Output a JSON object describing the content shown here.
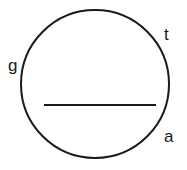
{
  "figure": {
    "type": "geometry-diagram",
    "background_color": "#ffffff",
    "stroke_color": "#1a1a1a",
    "stroke_width": 2,
    "canvas": {
      "width": 187,
      "height": 170
    },
    "circle": {
      "name": "circle-outline",
      "center_x": 95,
      "center_y": 84,
      "radius": 74,
      "fill": "none"
    },
    "chord": {
      "name": "horizontal-chord",
      "x1": 44,
      "y1": 105,
      "x2": 156,
      "y2": 105
    },
    "labels": [
      {
        "id": "g",
        "text": "g",
        "x": 12,
        "y": 65,
        "position": "left"
      },
      {
        "id": "t",
        "text": "t",
        "x": 167,
        "y": 34,
        "position": "upper-right"
      },
      {
        "id": "a",
        "text": "a",
        "x": 167,
        "y": 136,
        "position": "lower-right"
      }
    ]
  }
}
